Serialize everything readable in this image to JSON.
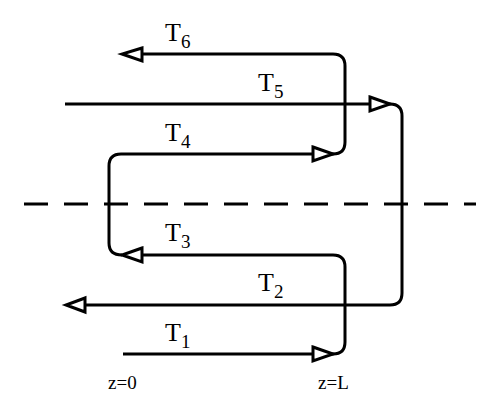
{
  "diagram": {
    "streams": [
      {
        "id": "T6",
        "base": "T",
        "sub": "6",
        "direction": "left"
      },
      {
        "id": "T5",
        "base": "T",
        "sub": "5",
        "direction": "right"
      },
      {
        "id": "T4",
        "base": "T",
        "sub": "4",
        "direction": "right"
      },
      {
        "id": "T3",
        "base": "T",
        "sub": "3",
        "direction": "left"
      },
      {
        "id": "T2",
        "base": "T",
        "sub": "2",
        "direction": "left"
      },
      {
        "id": "T1",
        "base": "T",
        "sub": "1",
        "direction": "right"
      }
    ],
    "axis_labels": {
      "left": "z=0",
      "right": "z=L"
    },
    "divider": "dashed"
  }
}
